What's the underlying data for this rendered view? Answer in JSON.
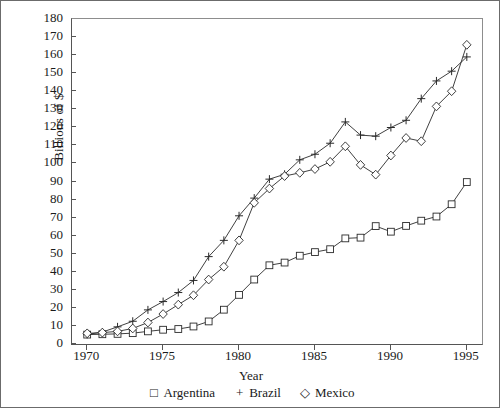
{
  "figure": {
    "y_axis_title": "Billions of $",
    "x_axis_title": "Year"
  },
  "legend": {
    "position": "bottom",
    "entries": [
      {
        "marker": "□",
        "label": "Argentina",
        "marker_name": "square-marker"
      },
      {
        "marker": "+",
        "label": "Brazil",
        "marker_name": "plus-marker"
      },
      {
        "marker": "◇",
        "label": "Mexico",
        "marker_name": "diamond-marker"
      }
    ]
  },
  "chart_data": {
    "type": "line",
    "title": "",
    "subtitle": "",
    "xlabel": "Year",
    "ylabel": "Billions of $",
    "xlim": [
      1969,
      1996
    ],
    "ylim": [
      0,
      180
    ],
    "xticks": [
      1970,
      1975,
      1980,
      1985,
      1990,
      1995
    ],
    "yticks": [
      0,
      10,
      20,
      30,
      40,
      50,
      60,
      70,
      80,
      90,
      100,
      110,
      120,
      130,
      140,
      150,
      160,
      170,
      180
    ],
    "grid": false,
    "legend_position": "bottom",
    "x": [
      1970,
      1971,
      1972,
      1973,
      1974,
      1975,
      1976,
      1977,
      1978,
      1979,
      1980,
      1981,
      1982,
      1983,
      1984,
      1985,
      1986,
      1987,
      1988,
      1989,
      1990,
      1991,
      1992,
      1993,
      1994,
      1995
    ],
    "series": [
      {
        "name": "Argentina",
        "marker": "square",
        "values": [
          5.2,
          5.4,
          5.6,
          6.0,
          7.0,
          7.9,
          8.3,
          9.7,
          12.5,
          19.0,
          27.2,
          35.7,
          43.6,
          45.1,
          48.9,
          50.9,
          52.5,
          58.5,
          58.9,
          65.3,
          62.2,
          65.4,
          68.3,
          70.6,
          77.4,
          89.7
        ]
      },
      {
        "name": "Brazil",
        "marker": "plus",
        "values": [
          5.3,
          6.6,
          9.5,
          12.6,
          18.9,
          23.5,
          28.5,
          35.2,
          48.4,
          57.4,
          71.0,
          80.8,
          91.3,
          94.0,
          102.0,
          105.1,
          111.2,
          123.0,
          115.7,
          115.1,
          119.9,
          123.9,
          135.9,
          145.7,
          151.1,
          159.0
        ]
      },
      {
        "name": "Mexico",
        "marker": "diamond",
        "values": [
          5.9,
          6.3,
          7.0,
          8.6,
          11.9,
          16.6,
          21.8,
          27.0,
          35.7,
          42.8,
          57.4,
          78.2,
          86.1,
          93.0,
          94.8,
          96.9,
          100.9,
          109.5,
          99.2,
          93.8,
          104.4,
          114.1,
          112.3,
          131.6,
          140.0,
          165.7
        ]
      }
    ]
  }
}
